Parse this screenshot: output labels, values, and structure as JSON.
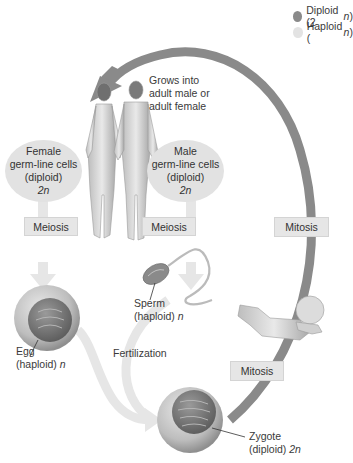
{
  "legend": {
    "items": [
      {
        "label": "Diploid (2",
        "var": "n",
        "close": ")",
        "color": "#8a8a8a"
      },
      {
        "label": "Haploid (",
        "var": "n",
        "close": ")",
        "color": "#e3e3e3"
      }
    ]
  },
  "grow_label": {
    "lines": [
      "Grows into",
      "adult male or",
      "adult female"
    ]
  },
  "female_cells": {
    "lines": [
      "Female",
      "germ-line cells",
      "(diploid)"
    ],
    "ploidy": "2n"
  },
  "male_cells": {
    "lines": [
      "Male",
      "germ-line cells",
      "(diploid)"
    ],
    "ploidy": "2n"
  },
  "process_boxes": {
    "meiosis_female": "Meiosis",
    "meiosis_male": "Meiosis",
    "mitosis_upper": "Mitosis",
    "mitosis_lower": "Mitosis"
  },
  "cells": {
    "sperm": {
      "line1": "Sperm",
      "line2": "(haploid) ",
      "ploidy": "n"
    },
    "egg": {
      "line1": "Egg",
      "line2": "(haploid) ",
      "ploidy": "n"
    },
    "zygote": {
      "line1": "Zygote",
      "line2": "(diploid) ",
      "ploidy": "2n"
    }
  },
  "fertilization_label": "Fertilization",
  "colors": {
    "diploid_arrow": "#8a8a8a",
    "haploid_arrow": "#e6e6e6",
    "box_fill": "#e6e6e6",
    "oval_fill": "#e2e2e2"
  }
}
